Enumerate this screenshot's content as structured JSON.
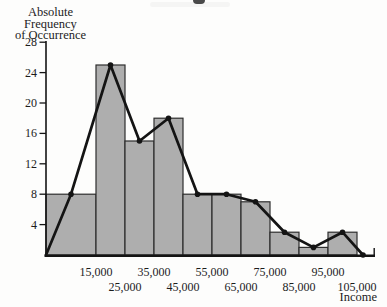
{
  "chart_data": {
    "type": "bar",
    "subtype": "histogram-with-frequency-polygon",
    "title": "",
    "ylabel_line1": "Absolute Frequency",
    "ylabel_line2": "of Occurrence",
    "xlabel": "Income",
    "y_ticks": [
      4,
      8,
      12,
      16,
      20,
      24,
      28
    ],
    "ylim": [
      0,
      28
    ],
    "bin_edge_labels_row1": [
      "15,000",
      "35,000",
      "55,000",
      "75,000",
      "95,000"
    ],
    "bin_edge_labels_row2": [
      "25,000",
      "45,000",
      "65,000",
      "85,000",
      "105,000"
    ],
    "bin_edge_labels": [
      "15,000",
      "25,000",
      "35,000",
      "45,000",
      "55,000",
      "65,000",
      "75,000",
      "85,000",
      "95,000",
      "105,000"
    ],
    "bar_values": [
      8,
      25,
      15,
      18,
      8,
      8,
      7,
      3,
      1,
      3
    ],
    "first_bar_note": "first bar is wider, spanning from the y-axis to the 15,000 edge",
    "polygon_values": [
      0,
      8,
      25,
      15,
      18,
      8,
      8,
      7,
      3,
      1,
      3,
      0
    ],
    "legend": [],
    "grid": "off",
    "colors": {
      "bar_fill": "#aeaeae",
      "bar_stroke": "#2e2e2e",
      "polygon_line": "#141414",
      "axis": "#141414",
      "background": "#fdfdfc"
    }
  }
}
